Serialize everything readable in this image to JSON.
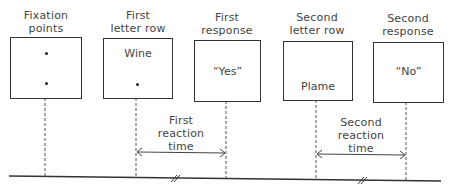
{
  "stages": [
    {
      "heading": [
        "Fixation",
        "points"
      ],
      "content": "",
      "dots": 2
    },
    {
      "heading": [
        "First",
        "letter row"
      ],
      "content": "Wine",
      "dots": 1
    },
    {
      "heading": [
        "First",
        "response"
      ],
      "content": "“Yes”",
      "dots": 0
    },
    {
      "heading": [
        "Second",
        "letter row"
      ],
      "content": "Plame",
      "dots": 0
    },
    {
      "heading": [
        "Second",
        "response"
      ],
      "content": "“No”",
      "dots": 0
    }
  ],
  "intervals": [
    {
      "label": [
        "First",
        "reaction",
        "time"
      ],
      "from_stage": 1,
      "to_stage": 2
    },
    {
      "label": [
        "Second",
        "reaction",
        "time"
      ],
      "from_stage": 3,
      "to_stage": 4
    }
  ],
  "timeline": {
    "break_marks": 2
  }
}
